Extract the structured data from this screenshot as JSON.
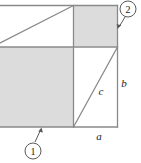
{
  "figure": {
    "colors": {
      "shade_fill": "#dcdcdc",
      "line_stroke": "#8a8a8a",
      "label_color": "#1a1a1a",
      "background": "#ffffff"
    },
    "side_labels": [
      {
        "id": "a",
        "text": "a",
        "x": 99,
        "y": 140,
        "desc": "bottom edge segment of small right triangle"
      },
      {
        "id": "b",
        "text": "b",
        "x": 124,
        "y": 87,
        "desc": "right edge vertical side of small right triangle"
      },
      {
        "id": "c",
        "text": "c",
        "x": 101,
        "y": 95,
        "desc": "hypotenuse of small right triangle"
      }
    ],
    "callouts": [
      {
        "id": "callout-1",
        "text": "1",
        "cx": 33,
        "cy": 151,
        "r": 8,
        "desc": "points to large shaded square (lower left)"
      },
      {
        "id": "callout-2",
        "text": "2",
        "cx": 128,
        "cy": 9,
        "r": 8,
        "desc": "points to small shaded square (upper right)"
      }
    ],
    "regions": [
      {
        "id": "large-shaded-square",
        "type": "shaded",
        "desc": "big square of side b, lower left"
      },
      {
        "id": "small-shaded-square",
        "type": "shaded",
        "desc": "small square of side a, upper right"
      },
      {
        "id": "upper-left-white-rect",
        "type": "white",
        "desc": "white rectangle with diagonal, upper left"
      },
      {
        "id": "lower-right-white-rect",
        "type": "white",
        "desc": "white rectangle with hypotenuse c, lower right"
      }
    ]
  }
}
